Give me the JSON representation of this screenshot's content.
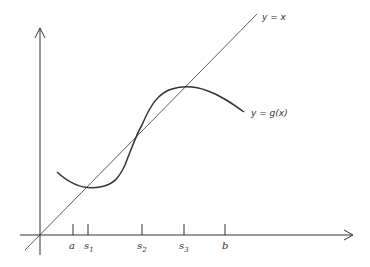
{
  "diagram": {
    "line_label": "y = x",
    "curve_label": "y = g(x)",
    "ticks": [
      {
        "id": "a",
        "base": "a",
        "sub": ""
      },
      {
        "id": "s1",
        "base": "s",
        "sub": "1"
      },
      {
        "id": "s2",
        "base": "s",
        "sub": "2"
      },
      {
        "id": "s3",
        "base": "s",
        "sub": "3"
      },
      {
        "id": "b",
        "base": "b",
        "sub": ""
      }
    ],
    "colors": {
      "stroke": "#333333",
      "background": "#ffffff"
    }
  }
}
